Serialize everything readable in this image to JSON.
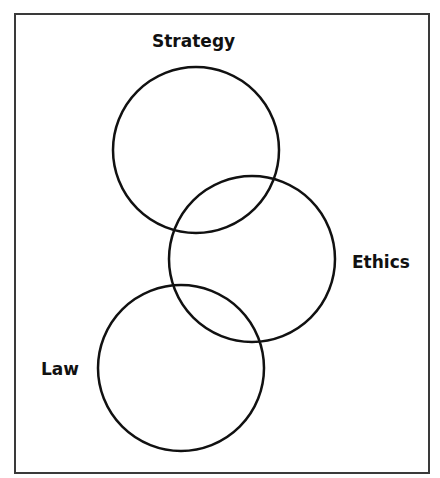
{
  "diagram": {
    "type": "venn-chain",
    "frame": {
      "border_color": "#3a3a3a"
    },
    "circles": [
      {
        "id": "strategy",
        "label": "Strategy",
        "cx": 196,
        "cy": 150,
        "r": 83
      },
      {
        "id": "ethics",
        "label": "Ethics",
        "cx": 252,
        "cy": 259,
        "r": 83
      },
      {
        "id": "law",
        "label": "Law",
        "cx": 181,
        "cy": 368,
        "r": 83
      }
    ],
    "stroke_color": "#111111",
    "stroke_width": 2.5
  },
  "labels": {
    "strategy": "Strategy",
    "ethics": "Ethics",
    "law": "Law"
  }
}
